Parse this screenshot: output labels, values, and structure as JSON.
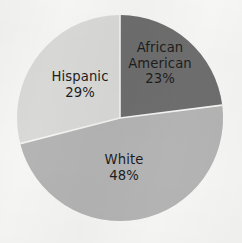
{
  "chart_data": {
    "type": "pie",
    "title": "",
    "subtitle": "",
    "xlabel": "",
    "ylabel": "",
    "legend": "none",
    "grid": false,
    "labels_inside_slices": true,
    "start_angle_deg": 0,
    "direction": "clockwise",
    "categories": [
      "African American",
      "White",
      "Hispanic"
    ],
    "values": [
      23,
      48,
      29
    ],
    "value_suffix": "%",
    "slices": [
      {
        "label": "African American",
        "label_line1": "African",
        "label_line2": "American",
        "value": 23,
        "value_text": "23%",
        "color": "#6e6e6e"
      },
      {
        "label": "White",
        "label_line1": "White",
        "label_line2": "",
        "value": 48,
        "value_text": "48%",
        "color": "#b4b4b4"
      },
      {
        "label": "Hispanic",
        "label_line1": "Hispanic",
        "label_line2": "",
        "value": 29,
        "value_text": "29%",
        "color": "#d9d9d8"
      }
    ]
  },
  "style": {
    "background_color": "#f6f6f5",
    "text_color": "#1d1d1d",
    "slice_divider_color": "#f4f4f3",
    "color_african_american": "#6e6e6e",
    "color_white": "#b4b4b4",
    "color_hispanic": "#d9d9d8"
  },
  "geometry": {
    "center_x": 120,
    "center_y": 118,
    "radius": 103
  }
}
